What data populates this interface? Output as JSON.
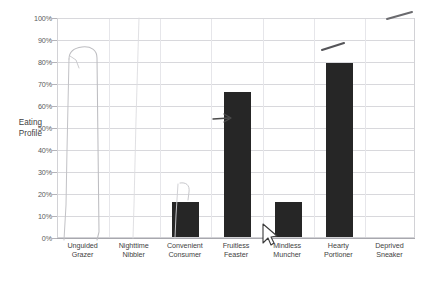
{
  "chart_data": {
    "type": "bar",
    "title": "",
    "xlabel": "",
    "ylabel": "Eating Profile",
    "ylim": [
      0,
      100
    ],
    "grid": true,
    "legend": "none",
    "bar_color": "#262626",
    "categories": [
      "Unguided Grazer",
      "Nighttime Nibbler",
      "Convenient Consumer",
      "Fruitless Feaster",
      "Mindless Muncher",
      "Hearty Portioner",
      "Deprived Sneaker"
    ],
    "values": [
      0,
      0,
      16,
      66,
      16,
      79,
      0
    ],
    "ytick_labels": [
      "0%",
      "10%",
      "20%",
      "30%",
      "40%",
      "50%",
      "60%",
      "70%",
      "80%",
      "90%",
      "100%"
    ],
    "ytick_values": [
      0,
      10,
      20,
      30,
      40,
      50,
      60,
      70,
      80,
      90,
      100
    ]
  },
  "axis": {
    "y_title_line1": "Eating",
    "y_title_line2": "Profile"
  },
  "xlabels": [
    {
      "line1": "Unguided",
      "line2": "Grazer"
    },
    {
      "line1": "Nighttime",
      "line2": "Nibbler"
    },
    {
      "line1": "Convenient",
      "line2": "Consumer"
    },
    {
      "line1": "Fruitless",
      "line2": "Feaster"
    },
    {
      "line1": "Mindless",
      "line2": "Muncher"
    },
    {
      "line1": "Hearty",
      "line2": "Portioner"
    },
    {
      "line1": "Deprived",
      "line2": "Sneaker"
    }
  ],
  "annotations": {
    "pencil_bar_outline": "hand-drawn-bar-outline-over-unguided-grazer",
    "pencil_bar_top_percent": 82,
    "arrow_fruitless": "small-right-arrow-at-fruitless-feaster",
    "stroke_above_mindless": "diagonal-pencil-stroke",
    "stroke_top_right": "diagonal-pencil-stroke",
    "cursor_mark": "mouse-cursor-arrow-near-mindless-muncher"
  },
  "colors": {
    "bar": "#262626",
    "grid": "#d8d8dc",
    "frame": "#d2d2d6",
    "axis": "#a8a8ae",
    "text": "#3f3f3f",
    "pencil": "#b9b9bd"
  }
}
